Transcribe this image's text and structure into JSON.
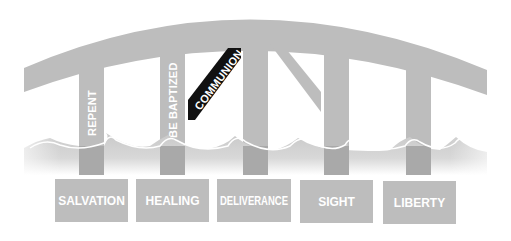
{
  "diagram": {
    "type": "bridge-illustration",
    "colors": {
      "structure": "#bdbdbd",
      "structure_dark": "#a9a9a9",
      "highlight": "#111111",
      "text": "#ffffff",
      "background": "#ffffff"
    },
    "pillars": [
      {
        "id": "repent",
        "label": "REPENT"
      },
      {
        "id": "be-baptized",
        "label": "BE BAPTIZED"
      },
      {
        "id": "communion",
        "label": "COMMUNION",
        "highlighted": true
      },
      {
        "id": "pillar-4",
        "label": ""
      },
      {
        "id": "pillar-5",
        "label": ""
      },
      {
        "id": "pillar-6",
        "label": ""
      }
    ],
    "boxes": [
      {
        "id": "salvation",
        "label": "SALVATION"
      },
      {
        "id": "healing",
        "label": "HEALING"
      },
      {
        "id": "deliverance",
        "label": "DELIVERANCE"
      },
      {
        "id": "sight",
        "label": "SIGHT"
      },
      {
        "id": "liberty",
        "label": "LIBERTY"
      }
    ]
  }
}
